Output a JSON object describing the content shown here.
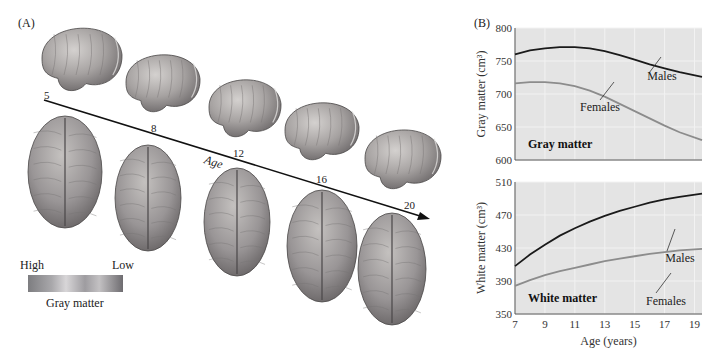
{
  "panel_a": {
    "label": "(A)",
    "arrow_label": "Age",
    "ages": [
      "5",
      "8",
      "12",
      "16",
      "20"
    ],
    "legend": {
      "high": "High",
      "low": "Low",
      "caption": "Gray matter",
      "gradient_colors": [
        "#7d7d80",
        "#a9a8ab",
        "#d8d6d8",
        "#9e9ca0",
        "#c3c1c3",
        "#6e6c70"
      ]
    },
    "brain_colors": {
      "light": "#c9c6c4",
      "mid": "#a19d9c",
      "dark": "#6f6b6c",
      "outline": "#4a4748"
    }
  },
  "panel_b": {
    "label": "(B)"
  },
  "chart_data": [
    {
      "type": "line",
      "title": "Gray matter",
      "xlabel": "",
      "ylabel": "Gray matter (cm³)",
      "xlim": [
        7,
        19.5
      ],
      "ylim": [
        600,
        800
      ],
      "yticks": [
        "600",
        "650",
        "700",
        "750",
        "800"
      ],
      "xticks": [],
      "grid": true,
      "background": "#e4e4e4",
      "series": [
        {
          "name": "Males",
          "color": "#1a1a1a",
          "x": [
            7,
            8,
            9,
            10,
            11,
            12,
            13,
            14,
            15,
            16,
            17,
            18,
            19.5
          ],
          "values": [
            760,
            766,
            769,
            771,
            771,
            769,
            765,
            759,
            752,
            745,
            739,
            733,
            726
          ]
        },
        {
          "name": "Females",
          "color": "#8c8c8c",
          "x": [
            7,
            8,
            9,
            10,
            11,
            12,
            13,
            14,
            15,
            16,
            17,
            18,
            19.5
          ],
          "values": [
            716,
            718,
            718,
            716,
            712,
            705,
            696,
            685,
            674,
            663,
            652,
            642,
            630
          ]
        }
      ],
      "annotations": [
        {
          "text": "Males",
          "series": "Males"
        },
        {
          "text": "Females",
          "series": "Females"
        }
      ]
    },
    {
      "type": "line",
      "title": "White matter",
      "xlabel": "Age (years)",
      "ylabel": "White matter (cm³)",
      "xlim": [
        7,
        19.5
      ],
      "ylim": [
        350,
        510
      ],
      "yticks": [
        "350",
        "390",
        "430",
        "470",
        "510"
      ],
      "xticks": [
        "7",
        "9",
        "11",
        "13",
        "15",
        "17",
        "19"
      ],
      "grid": true,
      "background": "#e4e4e4",
      "series": [
        {
          "name": "Males",
          "color": "#1a1a1a",
          "x": [
            7,
            8,
            9,
            10,
            11,
            12,
            13,
            14,
            15,
            16,
            17,
            18,
            19.5
          ],
          "values": [
            408,
            422,
            434,
            445,
            454,
            462,
            469,
            475,
            480,
            485,
            489,
            492,
            496
          ]
        },
        {
          "name": "Females",
          "color": "#8c8c8c",
          "x": [
            7,
            8,
            9,
            10,
            11,
            12,
            13,
            14,
            15,
            16,
            17,
            18,
            19.5
          ],
          "values": [
            384,
            391,
            397,
            402,
            406,
            410,
            414,
            417,
            420,
            423,
            425,
            427,
            429
          ]
        }
      ],
      "annotations": [
        {
          "text": "Males",
          "series": "Males"
        },
        {
          "text": "Females",
          "series": "Females"
        }
      ]
    }
  ]
}
